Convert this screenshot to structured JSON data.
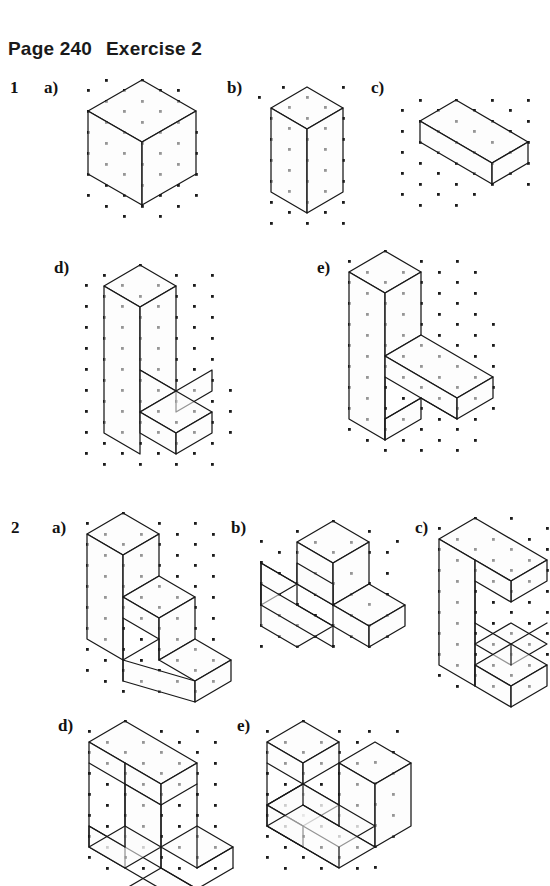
{
  "header": {
    "page_label": "Page 240",
    "exercise_label": "Exercise 2"
  },
  "questions": [
    {
      "number": "1",
      "items": [
        {
          "label": "a)",
          "shape": "cube"
        },
        {
          "label": "b)",
          "shape": "tall-rectangular-prism"
        },
        {
          "label": "c)",
          "shape": "flat-wide-box"
        },
        {
          "label": "d)",
          "shape": "l-shaped-step-solid"
        },
        {
          "label": "e)",
          "shape": "double-step-notched-solid"
        }
      ]
    },
    {
      "number": "2",
      "items": [
        {
          "label": "a)",
          "shape": "three-step-staircase"
        },
        {
          "label": "b)",
          "shape": "t-shaped-solid"
        },
        {
          "label": "c)",
          "shape": "c-shaped-bracket-solid"
        },
        {
          "label": "d)",
          "shape": "i-beam-solid"
        },
        {
          "label": "e)",
          "shape": "twin-block-solid"
        }
      ]
    }
  ],
  "grid": {
    "dot_color": "#1b1b1b",
    "line_color": "#181818",
    "face_fill": "#fbfbfb",
    "type": "isometric-dot-grid",
    "x_spacing_px": 18,
    "y_spacing_px": 21
  }
}
